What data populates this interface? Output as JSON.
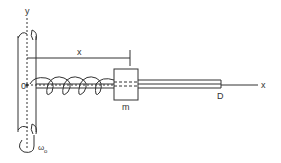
{
  "diagram": {
    "labels": {
      "y_axis": "y",
      "x_axis": "x",
      "origin": "0",
      "displacement": "x",
      "mass": "m",
      "rod_end": "D",
      "omega": "ω",
      "omega_sub": "o"
    },
    "colors": {
      "line": "#333333",
      "background": "#ffffff"
    }
  }
}
